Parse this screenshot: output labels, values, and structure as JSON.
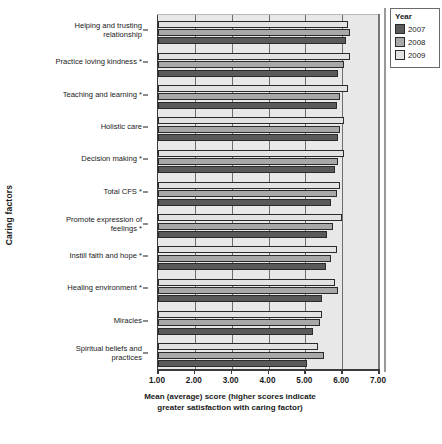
{
  "chart_data": {
    "type": "bar",
    "orientation": "horizontal",
    "title": "",
    "xlabel": "Mean (average) score (higher scores indicate greater satisfaction with caring factor)",
    "xlabel_line1": "Mean (average) score (higher scores indicate",
    "xlabel_line2": "greater satisfaction with caring factor)",
    "ylabel": "Caring factors",
    "xlim": [
      1.0,
      7.0
    ],
    "xticks": [
      1.0,
      2.0,
      3.0,
      4.0,
      5.0,
      6.0,
      7.0
    ],
    "xticklabels": [
      "1.00",
      "2.00",
      "3.00",
      "4.00",
      "5.00",
      "6.00",
      "7.00"
    ],
    "grid": true,
    "grid_axis": "x",
    "legend_position": "top-right",
    "legend_title": "Year",
    "categories": [
      "Helping and trusting relationship",
      "Practice loving kindness *",
      "Teaching and learning *",
      "Holistic care",
      "Decision making *",
      "Total CFS *",
      "Promote expression of feelings *",
      "Instill faith and hope *",
      "Healing environment *",
      "Miracles",
      "Spiritual beliefs and practices"
    ],
    "categories_wrapped": [
      [
        "Helping and trusting",
        "relationship"
      ],
      [
        "Practice loving kindness *"
      ],
      [
        "Teaching and learning *"
      ],
      [
        "Holistic care"
      ],
      [
        "Decision making *"
      ],
      [
        "Total CFS *"
      ],
      [
        "Promote expression of",
        "feelings *"
      ],
      [
        "Instill faith and hope *"
      ],
      [
        "Healing environment *"
      ],
      [
        "Miracles"
      ],
      [
        "Spiritual beliefs and",
        "practices"
      ]
    ],
    "series": [
      {
        "name": "2009",
        "color": "#e2e2e2",
        "values": [
          6.15,
          6.2,
          6.15,
          6.05,
          6.05,
          5.95,
          6.0,
          5.85,
          5.8,
          5.45,
          5.35
        ]
      },
      {
        "name": "2008",
        "color": "#a8a8a8",
        "values": [
          6.2,
          6.05,
          5.95,
          5.95,
          5.9,
          5.85,
          5.75,
          5.7,
          5.9,
          5.4,
          5.5
        ]
      },
      {
        "name": "2007",
        "color": "#5a5a5a",
        "values": [
          6.1,
          5.9,
          5.85,
          5.9,
          5.8,
          5.7,
          5.6,
          5.55,
          5.45,
          5.2,
          5.05
        ]
      }
    ],
    "legend_entries": [
      {
        "label": "2007",
        "color": "#5a5a5a"
      },
      {
        "label": "2008",
        "color": "#a8a8a8"
      },
      {
        "label": "2009",
        "color": "#e2e2e2"
      }
    ]
  }
}
